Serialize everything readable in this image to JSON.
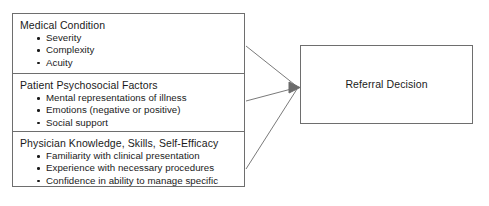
{
  "diagram": {
    "type": "flow-diagram",
    "background_color": "#ffffff",
    "line_color": "#6e6e6e",
    "text_color": "#1a1a1a",
    "factors": [
      {
        "id": "medical-condition",
        "heading": "Medical Condition",
        "bullets": [
          "Severity",
          "Complexity",
          "Acuity"
        ]
      },
      {
        "id": "patient-psychosocial-factors",
        "heading": "Patient Psychosocial Factors",
        "bullets": [
          "Mental representations of illness",
          "Emotions (negative or positive)",
          "Social support"
        ]
      },
      {
        "id": "physician-knowledge",
        "heading": "Physician Knowledge, Skills, Self-Efficacy",
        "bullets": [
          "Familiarity with clinical presentation",
          "Experience with necessary procedures",
          "Confidence in ability to manage specific"
        ]
      }
    ],
    "outcome": {
      "id": "referral-decision",
      "label": "Referral Decision"
    },
    "connectors": [
      {
        "from": "medical-condition",
        "to": "referral-decision",
        "arrowhead": true
      },
      {
        "from": "patient-psychosocial-factors",
        "to": "referral-decision",
        "arrowhead": true
      },
      {
        "from": "physician-knowledge",
        "to": "referral-decision",
        "arrowhead": true
      }
    ]
  }
}
